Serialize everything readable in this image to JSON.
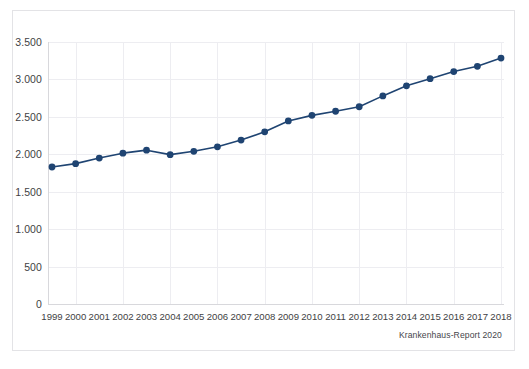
{
  "card": {
    "background": "#ffffff",
    "border_color": "#e3e3e6"
  },
  "source_note": "Krankenhaus-Report 2020",
  "chart_data": {
    "type": "line",
    "title": "",
    "subtitle": "",
    "xlabel": "",
    "ylabel": "",
    "categories": [
      "1999",
      "2000",
      "2001",
      "2002",
      "2003",
      "2004",
      "2005",
      "2006",
      "2007",
      "2008",
      "2009",
      "2010",
      "2011",
      "2012",
      "2013",
      "2014",
      "2015",
      "2016",
      "2017",
      "2018"
    ],
    "x_tick_labels": [
      "1999",
      "2000",
      "2001",
      "2002",
      "2003",
      "2004",
      "2005",
      "2006",
      "2007",
      "2008",
      "2009",
      "2010",
      "2011",
      "2012",
      "2013",
      "2014",
      "2015",
      "2016",
      "2017",
      "2018"
    ],
    "y_tick_labels": [
      "0",
      "500",
      "1.000",
      "1.500",
      "2.000",
      "2.500",
      "3.000",
      "3.500"
    ],
    "y_tick_values": [
      0,
      500,
      1000,
      1500,
      2000,
      2500,
      3000,
      3500
    ],
    "ylim": [
      0,
      3500
    ],
    "grid": true,
    "grid_color": "#ededf1",
    "legend": "none",
    "series": [
      {
        "name": "Fallzahl",
        "color": "#1f4472",
        "marker": "circle",
        "marker_color": "#1f4472",
        "line_width": 1.6,
        "values": [
          1830,
          1875,
          1950,
          2015,
          2055,
          1995,
          2040,
          2100,
          2190,
          2300,
          2445,
          2520,
          2575,
          2635,
          2780,
          2915,
          3010,
          3105,
          3175,
          3285
        ]
      }
    ]
  }
}
